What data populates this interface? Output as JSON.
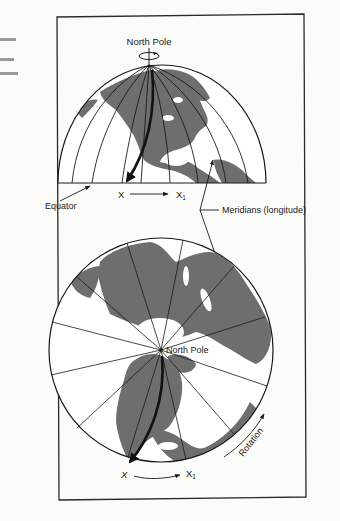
{
  "figure": {
    "top_globe": {
      "pole_label": "North Pole",
      "equator_label": "Equator",
      "point_start": "X",
      "point_end": "X",
      "point_end_subscript": "1"
    },
    "shared": {
      "meridians_label": "Meridians (longitude)"
    },
    "bottom_globe": {
      "pole_label": "North Pole",
      "point_start": "X",
      "point_end": "X",
      "point_end_subscript": "1",
      "rotation_label": "Rotation"
    },
    "colors": {
      "land": "#6e6e6e",
      "ocean": "#ffffff",
      "line": "#1a1a1a",
      "frame": "#2a2a2a",
      "background": "#fbfbf9"
    }
  }
}
